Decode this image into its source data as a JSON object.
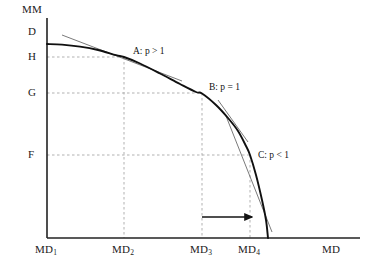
{
  "figure": {
    "kind": "production-possibility-frontier",
    "background_color": "#ffffff",
    "curve_color": "#101010",
    "tangent_color": "#6b6b6b",
    "guide_color": "#a8a8a8",
    "axis_color": "#222222"
  },
  "axes": {
    "y_title": "MM",
    "x_title": "MD",
    "y_ticks": [
      {
        "label": "D",
        "y_px": 32
      },
      {
        "label": "H",
        "y_px": 57
      },
      {
        "label": "G",
        "y_px": 93
      },
      {
        "label": "F",
        "y_px": 155
      }
    ],
    "x_ticks": [
      {
        "label": "MD",
        "sub": "1",
        "x_px": 47
      },
      {
        "label": "MD",
        "sub": "2",
        "x_px": 124
      },
      {
        "label": "MD",
        "sub": "3",
        "x_px": 202
      },
      {
        "label": "MD",
        "sub": "4",
        "x_px": 250
      }
    ],
    "origin_px": [
      47,
      238
    ],
    "x_axis_end_px": 360,
    "y_axis_top_px": 18
  },
  "points": [
    {
      "id": "A",
      "label": "A: p > 1",
      "x_px": 124,
      "y_px": 57,
      "label_x": 133,
      "label_y": 46
    },
    {
      "id": "B",
      "label": "B: p = 1",
      "x_px": 202,
      "y_px": 93,
      "label_x": 209,
      "label_y": 82
    },
    {
      "id": "C",
      "label": "C: p < 1",
      "x_px": 250,
      "y_px": 155,
      "label_x": 258,
      "label_y": 150
    }
  ],
  "annotations": {
    "shift_arrow": {
      "name": "rightward-shift-arrow",
      "x_start_px": 202,
      "x_end_px": 252,
      "y_px": 217
    }
  },
  "chart_data": {
    "type": "line",
    "title": "",
    "xlabel": "MD",
    "ylabel": "MM",
    "grid": false,
    "legend": null,
    "x_tick_labels": [
      "MD₁",
      "MD₂",
      "MD₃",
      "MD₄",
      "MD"
    ],
    "y_tick_labels": [
      "MM",
      "D",
      "H",
      "G",
      "F"
    ],
    "series": [
      {
        "name": "transformation-curve",
        "description": "Concave production possibility frontier from (MD1, H) to (MD4, 0)",
        "points_px": [
          [
            47,
            44
          ],
          [
            62,
            44.6
          ],
          [
            80,
            46.6
          ],
          [
            98,
            50.0
          ],
          [
            116,
            55.2
          ],
          [
            124,
            57.0
          ],
          [
            140,
            63.5
          ],
          [
            160,
            73.5
          ],
          [
            180,
            84.0
          ],
          [
            196,
            92.0
          ],
          [
            202,
            93.5
          ],
          [
            216,
            105.0
          ],
          [
            228,
            118.0
          ],
          [
            238,
            131.0
          ],
          [
            246,
            146.0
          ],
          [
            250,
            155.0
          ],
          [
            256,
            175.0
          ],
          [
            262,
            200.0
          ],
          [
            266,
            220.0
          ],
          [
            268,
            238.0
          ]
        ]
      }
    ],
    "tangents": [
      {
        "name": "tangent-at-A",
        "at_point": "A",
        "slope_label": "p > 1",
        "x1_px": 62,
        "y1_px": 35,
        "x2_px": 182,
        "y2_px": 81
      },
      {
        "name": "tangent-at-B",
        "at_point": "B",
        "slope_label": "p = 1",
        "x1_px": 218,
        "y1_px": 100,
        "x2_px": 248,
        "y2_px": 142
      },
      {
        "name": "tangent-at-C",
        "at_point": "C",
        "slope_label": "p < 1",
        "x1_px": 226,
        "y1_px": 116,
        "x2_px": 272,
        "y2_px": 232
      }
    ],
    "guides": [
      {
        "name": "guide-h-at-H",
        "orient": "horizontal",
        "y_px": 57,
        "x1_px": 47,
        "x2_px": 124
      },
      {
        "name": "guide-h-at-G",
        "orient": "horizontal",
        "y_px": 93,
        "x1_px": 47,
        "x2_px": 202
      },
      {
        "name": "guide-h-at-F",
        "orient": "horizontal",
        "y_px": 155,
        "x1_px": 47,
        "x2_px": 252
      },
      {
        "name": "guide-v-at-MD2",
        "orient": "vertical",
        "x_px": 124,
        "y1_px": 57,
        "y2_px": 238
      },
      {
        "name": "guide-v-at-MD3",
        "orient": "vertical",
        "x_px": 202,
        "y1_px": 93,
        "y2_px": 238
      },
      {
        "name": "guide-v-at-MD4",
        "orient": "vertical",
        "x_px": 250,
        "y1_px": 155,
        "y2_px": 238
      }
    ]
  }
}
